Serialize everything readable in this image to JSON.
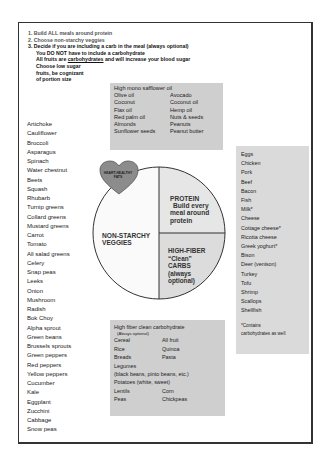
{
  "instructions": {
    "step1": "1. Build ALL meals around protein",
    "step2": "2. Choose non-starchy veggies",
    "step3": "3. Decide if you are including a carb in the meal (always optional)",
    "line4": "You DO NOT have to include a carbohydrate",
    "line5_pre": "All fruits are ",
    "line5_underlined": "carbohydrates",
    "line5_post": " and will increase your blood sugar",
    "line6": "Choose low sugar",
    "line7": "fruits, be cognizant",
    "line8": "of portion size"
  },
  "fats_box": {
    "title": "High mono safflower oil",
    "rows": [
      [
        "Olive oil",
        "Avocado"
      ],
      [
        "Coconut",
        "Coconut oil"
      ],
      [
        "Flax oil",
        "Hemp oil"
      ],
      [
        "Red palm oil",
        "Nuts & seeds"
      ],
      [
        "Almonds",
        "Peanuts"
      ],
      [
        "Sunflower seeds",
        "Peanut butter"
      ]
    ]
  },
  "veggies": [
    "Artichoke",
    "Cauliflower",
    "Broccoli",
    "Asparagus",
    "Spinach",
    "Water chestnut",
    "Beets",
    "Squash",
    "Rhubarb",
    "Turnip greens",
    "Collard greens",
    "Mustard greens",
    "Carrot",
    "Tomato",
    "All salad greens",
    "Celery",
    "Snap peas",
    "Leeks",
    "Onion",
    "Mushroom",
    "Radish",
    "Bok Choy",
    "Alpha sprout",
    "Green beans",
    "Brussels sprouts",
    "Green peppers",
    "Red peppers",
    "Yellow peppers",
    "Cucumber",
    "Kale",
    "Eggplant",
    "Zucchini",
    "Cabbage",
    "Snow peas"
  ],
  "plate": {
    "heart_label_1": "HEART-HEALTHY",
    "heart_label_2": "FATS",
    "veggies_label_1": "NON-STARCHY",
    "veggies_label_2": "VEGGIES",
    "protein_label_1": "PROTEIN",
    "protein_label_2": "Build every",
    "protein_label_3": "meal around",
    "protein_label_4": "protein",
    "carbs_label_1": "HIGH-FIBER",
    "carbs_label_2": "“Clean”",
    "carbs_label_3": "CARBS",
    "carbs_label_4": "(always",
    "carbs_label_5": "optional)",
    "colors": {
      "veggies": "#fafafa",
      "protein": "#e6e6e6",
      "carbs": "#dcdcdc",
      "heart": "#8c8c8c"
    }
  },
  "protein_box": {
    "items": [
      "Eggs",
      "Chicken",
      "Pork",
      "Beef",
      "Bacon",
      "Fish",
      "Milk*",
      "Cheese",
      "Cottage cheese*",
      "Ricotta cheese",
      "Greek yoghurt*",
      "Bison",
      "Deer (venison)",
      "Turkey",
      "Tofu",
      "Shrimp",
      "Scallops",
      "Shellfish"
    ],
    "note_1": "*Contains",
    "note_2": "carbohydrates as well"
  },
  "carb_box": {
    "title": "High fiber clean carbohydrate",
    "subtitle": "(Always optional)",
    "rows_a": [
      [
        "Cereal",
        "All fruit"
      ],
      [
        "Rice",
        "Quinoa"
      ],
      [
        "Breads",
        "Pasta"
      ]
    ],
    "legumes": "Legumes",
    "legumes_examples": "(black beans, pinto beans, etc.)",
    "potatoes": "Potatoes (white, sweet)",
    "rows_b": [
      [
        "Lentils",
        "Corn"
      ],
      [
        "Peas",
        "Chickpeas"
      ]
    ]
  }
}
